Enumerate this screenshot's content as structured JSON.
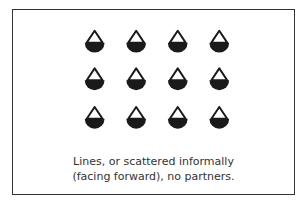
{
  "figure": {
    "caption_line1": "Lines, or scattered informally",
    "caption_line2": "(facing forward), no partners.",
    "rows": 3,
    "cols": 4,
    "dancer_icon": "dancer-facing-forward-icon",
    "dancer_color": "#1a1a1a",
    "frame_color": "#333333"
  }
}
